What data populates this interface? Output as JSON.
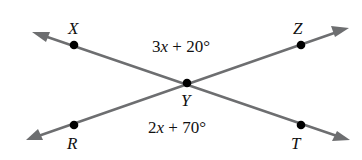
{
  "diagram": {
    "type": "intersecting-lines",
    "colors": {
      "line": "#6d6e70",
      "point": "#000000",
      "text": "#111111"
    },
    "points": {
      "X": {
        "label": "X",
        "x": 74,
        "y": 45
      },
      "Z": {
        "label": "Z",
        "x": 301,
        "y": 45
      },
      "Y": {
        "label": "Y",
        "x": 187,
        "y": 83
      },
      "R": {
        "label": "R",
        "x": 74,
        "y": 125
      },
      "T": {
        "label": "T",
        "x": 301,
        "y": 125
      }
    },
    "lines": [
      {
        "name": "line-XT",
        "through": [
          "X",
          "Y",
          "T"
        ],
        "arrows": "both"
      },
      {
        "name": "line-RZ",
        "through": [
          "R",
          "Y",
          "Z"
        ],
        "arrows": "both"
      }
    ],
    "angles": {
      "top": {
        "vertex": "Y",
        "between": [
          "X",
          "Z"
        ],
        "coef": "3",
        "var": "x",
        "rest": " + 20°",
        "full": "3x + 20°"
      },
      "bottom": {
        "vertex": "Y",
        "between": [
          "R",
          "T"
        ],
        "coef": "2",
        "var": "x",
        "rest": " + 70°",
        "full": "2x + 70°"
      }
    }
  }
}
